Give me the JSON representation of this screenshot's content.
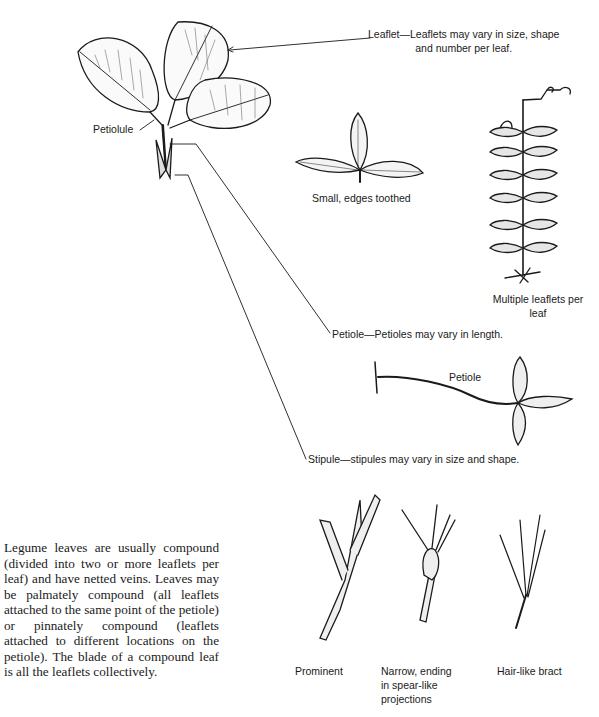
{
  "diagram": {
    "callouts": {
      "leaflet": {
        "line1": "Leaflet—Leaflets may vary in size, shape",
        "line2": "and number per leaf."
      },
      "petiolule": "Petiolule",
      "petiole": "Petiole—Petioles may vary in length.",
      "stipule": "Stipule—stipules may vary in size and shape."
    },
    "leaflet_examples": [
      {
        "caption": "Small, edges toothed"
      },
      {
        "caption_line1": "Multiple leaflets per",
        "caption_line2": "leaf"
      }
    ],
    "petiole_example": {
      "label": "Petiole"
    },
    "stipule_examples": [
      {
        "caption": "Prominent"
      },
      {
        "caption_line1": "Narrow, ending",
        "caption_line2": "in spear-like",
        "caption_line3": "projections"
      },
      {
        "caption": "Hair-like bract"
      }
    ],
    "description": "Legume leaves are usually compound (divided into two or more leaflets per leaf) and have netted veins. Leaves may be palmately compound (all leaflets attached to the same point of the petiole) or pinnately compound (leaflets attached to different locations on the petiole). The blade of a compound leaf is all the leaflets collectively."
  }
}
